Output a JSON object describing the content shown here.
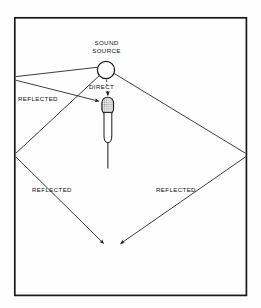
{
  "figure": {
    "title_visible": false,
    "background_color": "#fefefe",
    "line_color": "#1a1a1a",
    "border": {
      "x": 14,
      "y": 17,
      "width": 233,
      "height": 279,
      "stroke_width": 1.6
    }
  },
  "labels": {
    "sound_source_line1": "SOUND",
    "sound_source_line2": "SOURCE",
    "direct": "DIRECT",
    "reflected_upper_left": "REFLECTED",
    "reflected_lower_left": "REFLECTED",
    "reflected_lower_right": "REFLECTED"
  },
  "elements": {
    "sound_source": {
      "cx": 106,
      "cy": 70,
      "r": 9
    },
    "microphone": {
      "head_x": 102,
      "head_y": 97,
      "head_w": 12,
      "head_h": 18,
      "body_x": 104,
      "body_y": 112,
      "body_w": 8,
      "body_h": 30,
      "stem_x": 108,
      "stem_y1": 142,
      "stem_y2": 168
    },
    "wall_reflection_points": {
      "upper_left": {
        "x": 15,
        "y": 79
      },
      "left_vertex": {
        "x": 15,
        "y": 155
      },
      "right_vertex": {
        "x": 247,
        "y": 155
      }
    },
    "convergence": {
      "x": 111,
      "y": 247
    }
  },
  "ray_paths": {
    "direct": {
      "from": [
        106,
        79
      ],
      "to": [
        108,
        96
      ],
      "style": "dashed-then-arrow"
    },
    "reflected_upper": {
      "segments": [
        [
          106,
          70,
          15,
          77
        ],
        [
          15,
          80,
          101,
          101
        ]
      ],
      "arrow_at": [
        101,
        101
      ]
    },
    "reflected_left": {
      "segments": [
        [
          106,
          70,
          15,
          154
        ],
        [
          15,
          156,
          106,
          246
        ]
      ],
      "arrow_at": [
        106,
        246
      ]
    },
    "reflected_right": {
      "segments": [
        [
          110,
          72,
          246,
          154
        ],
        [
          246,
          156,
          118,
          246
        ]
      ],
      "arrow_at": [
        118,
        246
      ]
    }
  },
  "colors": {
    "ink": "#1a1a1a",
    "paper": "#fefefe",
    "mic_grille": "#9a9a9a"
  }
}
